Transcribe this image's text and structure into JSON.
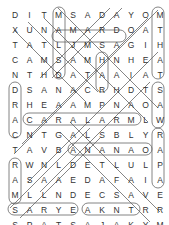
{
  "puzzle": {
    "rows": 15,
    "cols": 11,
    "grid": [
      [
        "D",
        "I",
        "T",
        "M",
        "S",
        "A",
        "D",
        "A",
        "Y",
        "O",
        "M"
      ],
      [
        "X",
        "U",
        "N",
        "A",
        "M",
        "A",
        "R",
        "D",
        "O",
        "A",
        "T"
      ],
      [
        "T",
        "A",
        "T",
        "L",
        "J",
        "M",
        "S",
        "A",
        "G",
        "I",
        "H"
      ],
      [
        "C",
        "A",
        "M",
        "S",
        "A",
        "M",
        "H",
        "N",
        "H",
        "E",
        "A"
      ],
      [
        "N",
        "T",
        "H",
        "D",
        "A",
        "T",
        "A",
        "A",
        "I",
        "A",
        "T"
      ],
      [
        "D",
        "S",
        "A",
        "N",
        "A",
        "C",
        "R",
        "H",
        "D",
        "T",
        "S"
      ],
      [
        "R",
        "H",
        "E",
        "A",
        "A",
        "M",
        "P",
        "N",
        "A",
        "O",
        "A"
      ],
      [
        "A",
        "C",
        "A",
        "R",
        "A",
        "L",
        "A",
        "R",
        "M",
        "L",
        "W"
      ],
      [
        "C",
        "N",
        "T",
        "G",
        "A",
        "L",
        "S",
        "B",
        "L",
        "Y",
        "R"
      ],
      [
        "T",
        "A",
        "V",
        "B",
        "A",
        "N",
        "A",
        "N",
        "A",
        "O",
        "A"
      ],
      [
        "R",
        "W",
        "N",
        "L",
        "D",
        "E",
        "T",
        "L",
        "U",
        "L",
        "P"
      ],
      [
        "A",
        "S",
        "A",
        "A",
        "E",
        "D",
        "A",
        "F",
        "A",
        "I",
        "A"
      ],
      [
        "M",
        "L",
        "L",
        "N",
        "D",
        "E",
        "C",
        "S",
        "A",
        "V",
        "E"
      ],
      [
        "S",
        "A",
        "R",
        "Y",
        "E",
        "A",
        "K",
        "N",
        "T",
        "R",
        "R"
      ],
      [
        "S",
        "P",
        "A",
        "T",
        "S",
        "A",
        "J",
        "A",
        "K",
        "Y",
        "M"
      ]
    ],
    "found_words": [
      {
        "word": "ALARM",
        "start": [
          7,
          3
        ],
        "end": [
          7,
          9
        ],
        "note": "horizontal row 8 (CARAL.. ALARM)"
      },
      {
        "word": "AMARD",
        "start": [
          1,
          3
        ],
        "end": [
          1,
          7
        ]
      },
      {
        "word": "BANANA",
        "start": [
          9,
          3
        ],
        "end": [
          9,
          8
        ]
      },
      {
        "word": "SPATS",
        "start": [
          14,
          0
        ],
        "end": [
          14,
          4
        ]
      },
      {
        "word": "AJAK",
        "start": [
          14,
          5
        ],
        "end": [
          14,
          8
        ]
      },
      {
        "word": "DRAM",
        "start": [
          5,
          0
        ],
        "end": [
          12,
          0
        ]
      },
      {
        "word": "THAT",
        "start": [
          1,
          10
        ],
        "end": [
          4,
          10
        ]
      },
      {
        "word": "SAW",
        "start": [
          5,
          10
        ],
        "end": [
          7,
          10
        ]
      },
      {
        "word": "RAP",
        "start": [
          8,
          10
        ],
        "end": [
          10,
          10
        ]
      }
    ],
    "colors": {
      "text": "#333333",
      "outline": "#555555",
      "background": "#ffffff"
    }
  }
}
